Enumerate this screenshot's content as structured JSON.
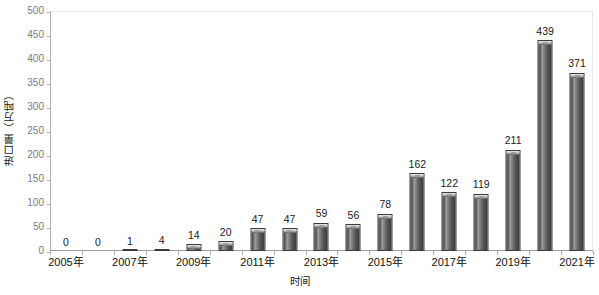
{
  "chart_data": {
    "type": "bar",
    "title": "",
    "xlabel": "时间",
    "ylabel": "进口量（万吨）",
    "categories": [
      "2005年",
      "2006年",
      "2007年",
      "2008年",
      "2009年",
      "2010年",
      "2011年",
      "2012年",
      "2013年",
      "2014年",
      "2015年",
      "2016年",
      "2017年",
      "2018年",
      "2019年",
      "2020年",
      "2021年"
    ],
    "values": [
      0,
      0,
      1,
      4,
      14,
      20,
      47,
      47,
      59,
      56,
      78,
      162,
      122,
      119,
      211,
      439,
      371
    ],
    "value_labels": [
      "0",
      "0",
      "1",
      "4",
      "14",
      "20",
      "47",
      "47",
      "59",
      "56",
      "78",
      "162",
      "122",
      "119",
      "211",
      "439",
      "371"
    ],
    "ylim": [
      0,
      500
    ],
    "ytick_values": [
      0,
      50,
      100,
      150,
      200,
      250,
      300,
      350,
      400,
      450,
      500
    ],
    "ytick_labels": [
      "0",
      "50",
      "100",
      "150",
      "200",
      "250",
      "300",
      "350",
      "400",
      "450",
      "500"
    ],
    "xtick_labels_shown": [
      "2005年",
      "2007年",
      "2009年",
      "2011年",
      "2013年",
      "2015年",
      "2017年",
      "2019年",
      "2021年"
    ],
    "xtick_label_indices": [
      0,
      2,
      4,
      6,
      8,
      10,
      12,
      14,
      16
    ],
    "grid": false,
    "legend": false,
    "bar_color": "#5a5a5a",
    "bar_edge_color": "#3a3a3a",
    "axis_color": "#b0b0b0",
    "tick_label_color": "#7b7b7b",
    "text_color": "#1a1a1a"
  }
}
